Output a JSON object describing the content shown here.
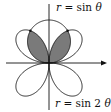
{
  "diagram": {
    "type": "polar-curves",
    "origin": [
      49,
      63
    ],
    "scale": 43,
    "curves": [
      {
        "name": "circle",
        "equation": "r = sin θ",
        "label_r": "r",
        "label_eq": "= sin",
        "label_var": "θ"
      },
      {
        "name": "rose",
        "equation": "r = sin 2θ",
        "label_r": "r",
        "label_eq": "= sin 2",
        "label_var": "θ"
      }
    ],
    "shaded_region": "inside both r = sin θ and r = sin 2θ (upper petals)",
    "intersection_angles_deg": [
      60,
      120
    ],
    "colors": {
      "stroke": "#111111",
      "shade": "#7a7a7a",
      "background": "#ffffff"
    }
  }
}
